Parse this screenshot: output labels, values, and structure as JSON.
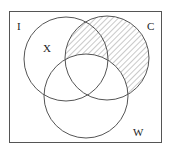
{
  "diagram": {
    "type": "venn",
    "universe_label": "I",
    "sets": [
      {
        "name": "X",
        "label": "X",
        "cx": 66,
        "cy": 59,
        "r": 42
      },
      {
        "name": "C",
        "label": "C",
        "cx": 107,
        "cy": 58,
        "r": 42
      },
      {
        "name": "W",
        "label": "W",
        "cx": 86,
        "cy": 96,
        "r": 42
      }
    ],
    "shaded_region": "C minus W",
    "colors": {
      "stroke": "#555555",
      "hatch": "#777777",
      "background": "#ffffff"
    }
  }
}
